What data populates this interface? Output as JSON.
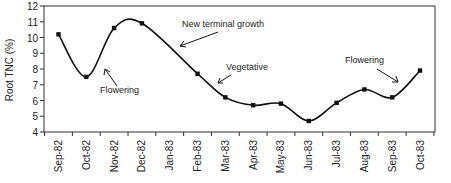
{
  "chart_data": {
    "type": "line",
    "title": "",
    "xlabel": "",
    "ylabel": "Root TNC (%)",
    "ylim": [
      4,
      12
    ],
    "yticks": [
      4,
      5,
      6,
      7,
      8,
      9,
      10,
      11,
      12
    ],
    "grid": false,
    "legend": null,
    "categories": [
      "Sep-82",
      "Oct-82",
      "Nov-82",
      "Dec-82",
      "Jan-83",
      "Feb-83",
      "Mar-83",
      "Apr-83",
      "May-83",
      "Jun-83",
      "Jul-83",
      "Aug-83",
      "Sep-83",
      "Oct-83"
    ],
    "series": [
      {
        "name": "Root TNC",
        "values": [
          10.2,
          7.5,
          10.6,
          10.9,
          null,
          7.7,
          6.2,
          5.7,
          5.8,
          4.7,
          5.85,
          6.7,
          6.2,
          7.9
        ],
        "smoothed": true,
        "marker": "square"
      }
    ],
    "annotations": [
      {
        "text": "Flowering",
        "points_to": "Oct-82 to Nov-82 rise"
      },
      {
        "text": "New terminal growth",
        "points_to": "Dec-82 to Jan-83 decline"
      },
      {
        "text": "Vegetative",
        "points_to": "Feb-83 to Mar-83 decline"
      },
      {
        "text": "Flowering",
        "points_to": "Sep-83 to Oct-83 rise"
      }
    ]
  },
  "annotations": {
    "flowering_1": "Flowering",
    "new_growth": "New terminal growth",
    "vegetative": "Vegetative",
    "flowering_2": "Flowering"
  },
  "axis": {
    "ylabel": "Root TNC (%)"
  }
}
